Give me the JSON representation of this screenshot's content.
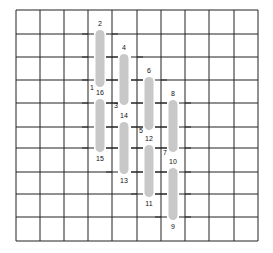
{
  "diagram": {
    "grid": {
      "x_lines": [
        16,
        40,
        64,
        88,
        112,
        137,
        161,
        185,
        209,
        234,
        258
      ],
      "y_lines": [
        10,
        34,
        57,
        80,
        103,
        127,
        148,
        172,
        194,
        217,
        241
      ],
      "line_color": "#222222",
      "tick_half_length": 6
    },
    "bar_color": "#c8c8c8",
    "bar_width": 9,
    "bars": [
      {
        "id": "bar-2-1",
        "cx": 100,
        "top": 30,
        "bottom": 87,
        "col": [
          88,
          112
        ],
        "top_label": "2",
        "bottom_label": "1",
        "bottom_label_pos": "left"
      },
      {
        "id": "bar-16-15",
        "cx": 100,
        "top": 99,
        "bottom": 152,
        "col": [
          88,
          112
        ],
        "top_label": "16",
        "bottom_label": "15",
        "bottom_label_pos": "below"
      },
      {
        "id": "bar-4-3",
        "cx": 124,
        "top": 54,
        "bottom": 105,
        "col": [
          112,
          137
        ],
        "top_label": "4",
        "bottom_label": "3",
        "bottom_label_pos": "left"
      },
      {
        "id": "bar-14-13",
        "cx": 124,
        "top": 122,
        "bottom": 174,
        "col": [
          112,
          137
        ],
        "top_label": "14",
        "bottom_label": "13",
        "bottom_label_pos": "below"
      },
      {
        "id": "bar-6-5",
        "cx": 149,
        "top": 77,
        "bottom": 130,
        "col": [
          137,
          161
        ],
        "top_label": "6",
        "bottom_label": "5",
        "bottom_label_pos": "left"
      },
      {
        "id": "bar-12-11",
        "cx": 149,
        "top": 145,
        "bottom": 197,
        "col": [
          137,
          161
        ],
        "top_label": "12",
        "bottom_label": "11",
        "bottom_label_pos": "below"
      },
      {
        "id": "bar-8-7",
        "cx": 173,
        "top": 100,
        "bottom": 152,
        "col": [
          161,
          185
        ],
        "top_label": "8",
        "bottom_label": "7",
        "bottom_label_pos": "left"
      },
      {
        "id": "bar-10-9",
        "cx": 173,
        "top": 168,
        "bottom": 220,
        "col": [
          161,
          185
        ],
        "top_label": "10",
        "bottom_label": "9",
        "bottom_label_pos": "below"
      }
    ],
    "labels": [
      "1",
      "2",
      "3",
      "4",
      "5",
      "6",
      "7",
      "8",
      "9",
      "10",
      "11",
      "12",
      "13",
      "14",
      "15",
      "16"
    ]
  }
}
